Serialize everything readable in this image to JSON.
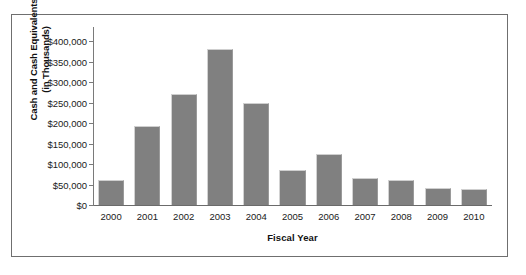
{
  "chart_data": {
    "type": "bar",
    "title": "",
    "xlabel": "Fiscal Year",
    "ylabel": "Cash and Cash Equivalents (in Thousands)",
    "ylabel_line1": "Cash and Cash Equivalents",
    "ylabel_line2": "(in Thousands)",
    "categories": [
      "2000",
      "2001",
      "2002",
      "2003",
      "2004",
      "2005",
      "2006",
      "2007",
      "2008",
      "2009",
      "2010"
    ],
    "values": [
      60000,
      192000,
      270000,
      380000,
      248000,
      85000,
      125000,
      65000,
      60000,
      42000,
      38000
    ],
    "ylim": [
      0,
      400000
    ],
    "ytick_values": [
      0,
      50000,
      100000,
      150000,
      200000,
      250000,
      300000,
      350000,
      400000
    ],
    "ytick_labels": [
      "$0",
      "$50,000",
      "$100,000",
      "$150,000",
      "$200,000",
      "$250,000",
      "$300,000",
      "$350,000",
      "$400,000"
    ],
    "grid": false,
    "legend": "none",
    "bar_color": "#808080",
    "axis_color": "#6f6f6f",
    "background_color": "#ffffff"
  },
  "frame": {
    "border_color": "#6f6f6f"
  },
  "caption": {
    "partial_text": ""
  }
}
